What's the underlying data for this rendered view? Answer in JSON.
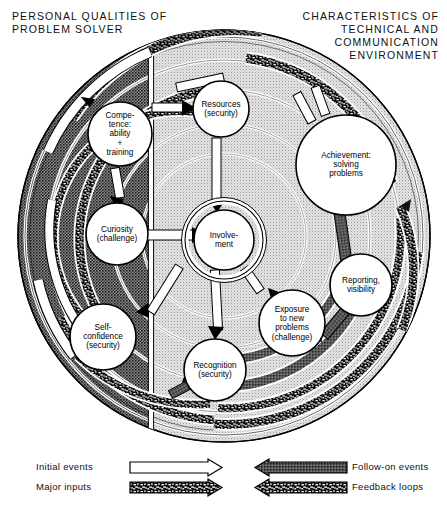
{
  "headers": {
    "left": "PERSONAL QUALITIES OF\nPROBLEM SOLVER",
    "right": "CHARACTERISTICS OF\nTECHNICAL AND\nCOMMUNICATION\nENVIRONMENT"
  },
  "nodes": [
    {
      "id": "competence",
      "label": "Compe-\ntence:\nability\n+\ntraining",
      "cx": 120,
      "cy": 134,
      "r": 32
    },
    {
      "id": "resources",
      "label": "Resources\n(security)",
      "cx": 221,
      "cy": 109,
      "r": 28
    },
    {
      "id": "achievement",
      "label": "Achievement:\nsolving\nproblems",
      "cx": 346,
      "cy": 165,
      "r": 50
    },
    {
      "id": "curiosity",
      "label": "Curiosity\n(challenge)",
      "cx": 117,
      "cy": 234,
      "r": 31
    },
    {
      "id": "involvement",
      "label": "Involve-\nment",
      "cx": 224,
      "cy": 240,
      "r": 30
    },
    {
      "id": "reporting",
      "label": "Reporting,\nvisibility",
      "cx": 361,
      "cy": 285,
      "r": 31
    },
    {
      "id": "exposure",
      "label": "Exposure\nto new\nproblems\n(challenge)",
      "cx": 292,
      "cy": 323,
      "r": 33
    },
    {
      "id": "selfconf",
      "label": "Self-\nconfidence\n(security)",
      "cx": 103,
      "cy": 337,
      "r": 33
    },
    {
      "id": "recognition",
      "label": "Recognition\n(security)",
      "cx": 215,
      "cy": 370,
      "r": 31
    }
  ],
  "legend": {
    "items": [
      {
        "id": "initial-events",
        "label": "Initial events",
        "style": "white",
        "dir": "right",
        "side": "left"
      },
      {
        "id": "major-inputs",
        "label": "Major inputs",
        "style": "dark-speckle",
        "dir": "right",
        "side": "left"
      },
      {
        "id": "follow-on-events",
        "label": "Follow-on events",
        "style": "dark",
        "dir": "left",
        "side": "right"
      },
      {
        "id": "feedback-loops",
        "label": "Feedback loops",
        "style": "dark-speckle",
        "dir": "left",
        "side": "right"
      }
    ]
  },
  "colors": {
    "left_half": "#6f6f6f",
    "right_half": "#d2d2d2",
    "outline": "#000000",
    "arrow_dark": "#4e4e4e",
    "arrow_white": "#ffffff",
    "background": "#ffffff"
  },
  "chart_data": {
    "type": "diagram",
    "halves": [
      {
        "name": "PERSONAL QUALITIES OF PROBLEM SOLVER",
        "shade": "dark"
      },
      {
        "name": "CHARACTERISTICS OF TECHNICAL AND COMMUNICATION ENVIRONMENT",
        "shade": "light"
      }
    ],
    "center": "Involvement",
    "nodes": [
      "Compe-tence: ability + training",
      "Resources (security)",
      "Achievement: solving problems",
      "Curiosity (challenge)",
      "Involvement",
      "Reporting, visibility",
      "Exposure to new problems (challenge)",
      "Self-confidence (security)",
      "Recognition (security)"
    ],
    "edge_types": [
      "Initial events",
      "Major inputs",
      "Follow-on events",
      "Feedback loops"
    ]
  }
}
